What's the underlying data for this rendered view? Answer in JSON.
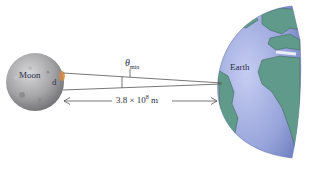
{
  "diagram": {
    "moon": {
      "label": "Moon",
      "diameter_label": "d"
    },
    "earth": {
      "label": "Earth"
    },
    "angle": {
      "symbol": "θ",
      "subscript": "min"
    },
    "distance": {
      "mantissa": "3.8 × 10",
      "exponent": "8",
      "unit": " m"
    },
    "colors": {
      "moon": "#a9a9ab",
      "ocean": "#9aa6dc",
      "land": "#5f9a8a",
      "lines": "#555555",
      "text": "#2b2f45"
    }
  }
}
